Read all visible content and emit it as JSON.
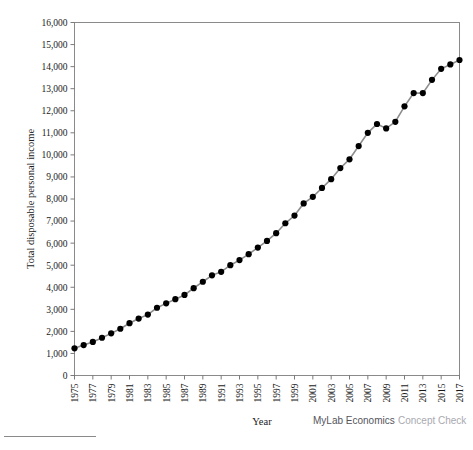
{
  "chart_data": {
    "type": "line",
    "title": "",
    "xlabel": "Year",
    "ylabel": "Total disposable personal income",
    "xlim": [
      1975,
      2017
    ],
    "ylim": [
      0,
      16000
    ],
    "grid": true,
    "legend": "none",
    "x_tick_labels": [
      "1975",
      "1977",
      "1979",
      "1981",
      "1983",
      "1985",
      "1987",
      "1989",
      "1991",
      "1993",
      "1995",
      "1997",
      "1999",
      "2001",
      "2003",
      "2005",
      "2007",
      "2009",
      "2011",
      "2013",
      "2015",
      "2017"
    ],
    "y_tick_labels": [
      "0",
      "1,000",
      "2,000",
      "3,000",
      "4,000",
      "5,000",
      "6,000",
      "7,000",
      "8,000",
      "9,000",
      "10,000",
      "11,000",
      "12,000",
      "13,000",
      "14,000",
      "15,000",
      "16,000"
    ],
    "y_tick_values": [
      0,
      1000,
      2000,
      3000,
      4000,
      5000,
      6000,
      7000,
      8000,
      9000,
      10000,
      11000,
      12000,
      13000,
      14000,
      15000,
      16000
    ],
    "x": [
      1975,
      1976,
      1977,
      1978,
      1979,
      1980,
      1981,
      1982,
      1983,
      1984,
      1985,
      1986,
      1987,
      1988,
      1989,
      1990,
      1991,
      1992,
      1993,
      1994,
      1995,
      1996,
      1997,
      1998,
      1999,
      2000,
      2001,
      2002,
      2003,
      2004,
      2005,
      2006,
      2007,
      2008,
      2009,
      2010,
      2011,
      2012,
      2013,
      2014,
      2015,
      2016,
      2017
    ],
    "values": [
      1230,
      1380,
      1520,
      1710,
      1910,
      2120,
      2370,
      2580,
      2760,
      3070,
      3270,
      3460,
      3650,
      3960,
      4250,
      4540,
      4700,
      5000,
      5230,
      5500,
      5800,
      6100,
      6450,
      6900,
      7250,
      7800,
      8100,
      8500,
      8900,
      9400,
      9800,
      10400,
      11000,
      11400,
      11200,
      11500,
      12200,
      12800,
      12800,
      13400,
      13900,
      14100,
      14300
    ],
    "series": [
      {
        "name": "Total disposable personal income",
        "values": [
          1230,
          1380,
          1520,
          1710,
          1910,
          2120,
          2370,
          2580,
          2760,
          3070,
          3270,
          3460,
          3650,
          3960,
          4250,
          4540,
          4700,
          5000,
          5230,
          5500,
          5800,
          6100,
          6450,
          6900,
          7250,
          7800,
          8100,
          8500,
          8900,
          9400,
          9800,
          10400,
          11000,
          11400,
          11200,
          11500,
          12200,
          12800,
          12800,
          13400,
          13900,
          14100,
          14300
        ]
      }
    ]
  },
  "branding": {
    "primary": "MyLab Economics",
    "secondary": "Concept Check"
  },
  "colors": {
    "line": "#8d8d8d",
    "marker": "#000000",
    "frame": "#8a8a8a",
    "grid_minor": "#eef0f4",
    "grid_major": "#e2e5ea",
    "brand_primary": "#55555c",
    "brand_secondary": "#a9a9b0"
  }
}
